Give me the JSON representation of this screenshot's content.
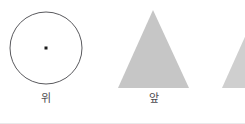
{
  "figure": {
    "background_color": "#ffffff",
    "width": 245,
    "height": 124
  },
  "views": [
    {
      "id": "top-view",
      "shape": "circle",
      "label": "위",
      "label_meaning": "top",
      "stroke_color": "#5a5a5e",
      "fill_color": "none",
      "center": {
        "x": 46,
        "y": 48
      },
      "radius": 36,
      "center_marker": {
        "shape": "square-dot",
        "color": "#1a1a1a",
        "size": 3,
        "x": 46,
        "y": 48
      }
    },
    {
      "id": "front-view",
      "shape": "triangle",
      "label": "앞",
      "label_meaning": "front",
      "fill_color": "#c6c6c6",
      "stroke_color": "none",
      "apex": {
        "x": 153,
        "y": 10
      },
      "base_left": {
        "x": 118,
        "y": 88
      },
      "base_right": {
        "x": 189,
        "y": 88
      }
    },
    {
      "id": "side-view",
      "shape": "triangle",
      "label": "",
      "label_meaning": "side (clipped at right edge)",
      "fill_color": "#cfcfcf",
      "stroke_color": "none",
      "apex": {
        "x": 257,
        "y": 10
      },
      "base_left": {
        "x": 222,
        "y": 88
      },
      "base_right": {
        "x": 293,
        "y": 88
      },
      "clipped": true
    }
  ],
  "colors": {
    "outline": "#5a5a5e",
    "shape_fill": "#c6c6c6",
    "shape_fill_light": "#cfcfcf",
    "label_text": "#4b4b4f",
    "bottom_rule": "#e9e9ea",
    "dot": "#1a1a1a"
  }
}
